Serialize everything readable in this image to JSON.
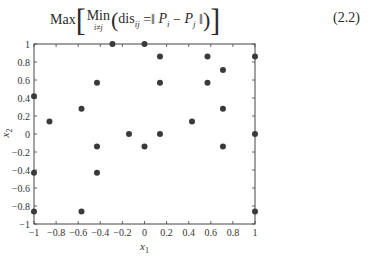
{
  "formula": {
    "max": "Max",
    "min": "Min",
    "min_sub": "i≠j",
    "dis": "dis",
    "dis_sub": "ij",
    "eq": " =‖ ",
    "pi": "P",
    "pi_sub": "i",
    "minus": " − ",
    "pj": "P",
    "pj_sub": "j",
    "close_norm": " ‖",
    "equation_number": "(2.2)"
  },
  "chart_data": {
    "type": "scatter",
    "title": "",
    "xlabel": "x1",
    "ylabel": "x2",
    "xlim": [
      -1,
      1
    ],
    "ylim": [
      -1,
      1
    ],
    "grid": false,
    "legend": null,
    "xticks": [
      -1,
      -0.8,
      -0.6,
      -0.4,
      -0.2,
      0,
      0.2,
      0.4,
      0.6,
      0.8,
      1
    ],
    "yticks": [
      -1,
      -0.8,
      -0.6,
      -0.4,
      -0.2,
      0,
      0.2,
      0.4,
      0.6,
      0.8,
      1
    ],
    "xtick_labels": [
      "−1",
      "−0.8",
      "−0.6",
      "−0.4",
      "−0.2",
      "0",
      "0.2",
      "0.4",
      "0.6",
      "0.8",
      "1"
    ],
    "ytick_labels": [
      "−1",
      "−0.8",
      "−0.6",
      "−0.4",
      "−0.2",
      "0",
      "0.2",
      "0.4",
      "0.6",
      "0.8",
      "1"
    ],
    "marker_color": "#3a3a3a",
    "points": [
      [
        -1,
        0.42
      ],
      [
        -1,
        -0.43
      ],
      [
        -1,
        -0.86
      ],
      [
        -0.86,
        0.14
      ],
      [
        -0.57,
        0.28
      ],
      [
        -0.57,
        -0.86
      ],
      [
        -0.43,
        0.57
      ],
      [
        -0.43,
        -0.14
      ],
      [
        -0.43,
        -0.43
      ],
      [
        -0.29,
        1
      ],
      [
        -0.14,
        0
      ],
      [
        0,
        1
      ],
      [
        0,
        -0.14
      ],
      [
        0.14,
        0.86
      ],
      [
        0.14,
        0.57
      ],
      [
        0.14,
        0
      ],
      [
        0.43,
        0.14
      ],
      [
        0.57,
        0.86
      ],
      [
        0.57,
        0.57
      ],
      [
        0.71,
        0.71
      ],
      [
        0.71,
        0.28
      ],
      [
        0.71,
        -0.14
      ],
      [
        1,
        0.86
      ],
      [
        1,
        0
      ],
      [
        1,
        -0.86
      ]
    ]
  }
}
